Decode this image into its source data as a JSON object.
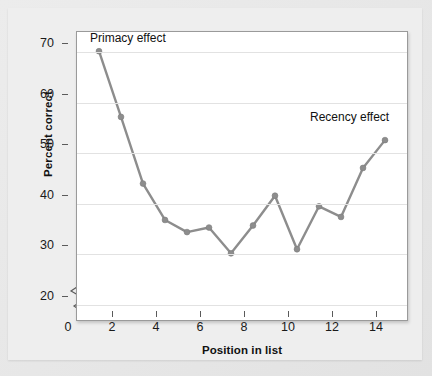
{
  "chart_data": {
    "type": "line",
    "title": "",
    "xlabel": "Position in list",
    "ylabel": "Percent correct",
    "xlim": [
      0,
      15
    ],
    "ylim": [
      17,
      74
    ],
    "y_axis_break": true,
    "grid": true,
    "legend": "none",
    "series_color": "#8d8d8d",
    "x": [
      1,
      2,
      3,
      4,
      5,
      6,
      7,
      8,
      9,
      10,
      11,
      12,
      13,
      14
    ],
    "values": [
      70.2,
      57.2,
      44.0,
      36.8,
      34.4,
      35.3,
      30.2,
      35.7,
      41.6,
      31.0,
      39.5,
      37.4,
      47.1,
      52.6
    ],
    "xticks": [
      "0",
      "2",
      "4",
      "6",
      "8",
      "10",
      "12",
      "14"
    ],
    "xtick_values": [
      0,
      2,
      4,
      6,
      8,
      10,
      12,
      14
    ],
    "yticks": [
      "20",
      "30",
      "40",
      "50",
      "60",
      "70"
    ],
    "ytick_values": [
      20,
      30,
      40,
      50,
      60,
      70
    ],
    "annotations": [
      {
        "text": "Primacy effect",
        "x_px": 90,
        "y_px": 31
      },
      {
        "text": "Recency effect",
        "x_px": 310,
        "y_px": 110
      }
    ]
  },
  "axis": {
    "y_label": "Percent correct",
    "x_label": "Position in list",
    "break_icon": "axis-break-zigzag"
  },
  "annotations": {
    "primacy": "Primacy effect",
    "recency": "Recency effect"
  },
  "colors": {
    "line": "#8d8d8d",
    "marker": "#8d8d8d",
    "grid": "#e2e2e2",
    "plot_background": "#ffffff",
    "page_background": "#e9e9e9",
    "axis": "#5a5a5a",
    "text": "#111111"
  }
}
